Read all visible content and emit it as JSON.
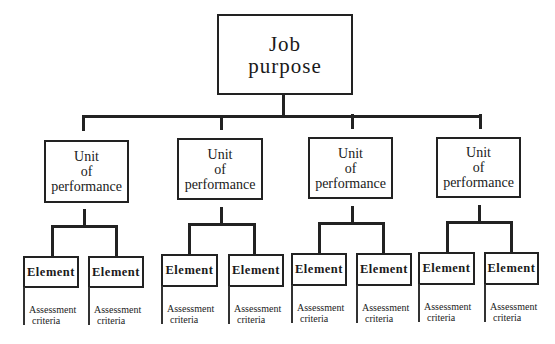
{
  "diagram": {
    "type": "hierarchy",
    "root": {
      "line1": "Job",
      "line2": "purpose"
    },
    "units": [
      {
        "line1": "Unit",
        "line2": "of",
        "line3": "performance",
        "elements": [
          {
            "label": "Element",
            "criteria1": "Assessment",
            "criteria2": "criteria"
          },
          {
            "label": "Element",
            "criteria1": "Assessment",
            "criteria2": "criteria"
          }
        ]
      },
      {
        "line1": "Unit",
        "line2": "of",
        "line3": "performance",
        "elements": [
          {
            "label": "Element",
            "criteria1": "Assessment",
            "criteria2": "criteria"
          },
          {
            "label": "Element",
            "criteria1": "Assessment",
            "criteria2": "criteria"
          }
        ]
      },
      {
        "line1": "Unit",
        "line2": "of",
        "line3": "performance",
        "elements": [
          {
            "label": "Element",
            "criteria1": "Assessment",
            "criteria2": "criteria"
          },
          {
            "label": "Element",
            "criteria1": "Assessment",
            "criteria2": "criteria"
          }
        ]
      },
      {
        "line1": "Unit",
        "line2": "of",
        "line3": "performance",
        "elements": [
          {
            "label": "Element",
            "criteria1": "Assessment",
            "criteria2": "criteria"
          },
          {
            "label": "Element",
            "criteria1": "Assessment",
            "criteria2": "criteria"
          }
        ]
      }
    ],
    "colors": {
      "line": "#222222",
      "background": "#ffffff",
      "text": "#1a1a1a"
    }
  }
}
